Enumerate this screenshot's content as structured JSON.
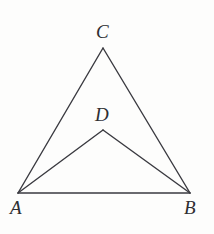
{
  "figure": {
    "type": "geometry-diagram",
    "canvas": {
      "width": 214,
      "height": 234
    },
    "background_color": "#fdfdfc",
    "stroke_color": "#3a3a40",
    "stroke_width": 1.4,
    "label_color": "#2e2e32",
    "label_font_size": 19,
    "points": [
      {
        "id": "A",
        "label": "A",
        "x": 18,
        "y": 193,
        "label_x": 10,
        "label_y": 198
      },
      {
        "id": "B",
        "label": "B",
        "x": 190,
        "y": 193,
        "label_x": 184,
        "label_y": 198
      },
      {
        "id": "C",
        "label": "C",
        "x": 103,
        "y": 48,
        "label_x": 96,
        "label_y": 22
      },
      {
        "id": "D",
        "label": "D",
        "x": 103,
        "y": 130,
        "label_x": 95,
        "label_y": 105
      }
    ],
    "segments": [
      {
        "id": "AC",
        "from": "A",
        "to": "C",
        "x1": 18,
        "y1": 193,
        "x2": 103,
        "y2": 48
      },
      {
        "id": "CB",
        "from": "C",
        "to": "B",
        "x1": 103,
        "y1": 48,
        "x2": 190,
        "y2": 193
      },
      {
        "id": "AB",
        "from": "A",
        "to": "B",
        "x1": 18,
        "y1": 193,
        "x2": 190,
        "y2": 193
      },
      {
        "id": "AD",
        "from": "A",
        "to": "D",
        "x1": 18,
        "y1": 193,
        "x2": 103,
        "y2": 130
      },
      {
        "id": "DB",
        "from": "D",
        "to": "B",
        "x1": 103,
        "y1": 130,
        "x2": 190,
        "y2": 193
      }
    ]
  }
}
